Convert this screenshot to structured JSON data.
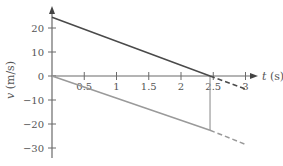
{
  "chart_data": {
    "type": "line",
    "title": "",
    "xlabel": "t (s)",
    "ylabel": "v (m/s)",
    "xlim": [
      0,
      3.2
    ],
    "ylim": [
      -33,
      28
    ],
    "xticks": [
      0.5,
      1,
      1.5,
      2,
      2.5,
      3
    ],
    "xtick_labels": [
      "0.5",
      "1",
      "1.5",
      "2",
      "2.5",
      "3"
    ],
    "yticks": [
      20,
      10,
      0,
      -10,
      -20,
      -30
    ],
    "ytick_labels": [
      "20",
      "10",
      "0",
      "−10",
      "−20",
      "−30"
    ],
    "grid": false,
    "legend": null,
    "series": [
      {
        "name": "upper",
        "color": "#4a4a4a",
        "style": "solid",
        "x": [
          0,
          2.45
        ],
        "y": [
          24.5,
          0
        ]
      },
      {
        "name": "upper-extension",
        "color": "#4a4a4a",
        "style": "dashed",
        "x": [
          2.45,
          3.0
        ],
        "y": [
          0,
          -5.4
        ]
      },
      {
        "name": "lower",
        "color": "#9a9a9a",
        "style": "solid",
        "x": [
          0,
          2.45
        ],
        "y": [
          0,
          -22.6
        ]
      },
      {
        "name": "lower-extension",
        "color": "#9a9a9a",
        "style": "dashed",
        "x": [
          2.45,
          3.0
        ],
        "y": [
          -22.6,
          -28.5
        ]
      }
    ],
    "annotations": [
      {
        "type": "vertical-line",
        "x": 2.45,
        "y_from": 0,
        "y_to": -22.6,
        "color": "#9a9a9a"
      }
    ]
  },
  "axes": {
    "x_label_var": "t",
    "x_label_unit": " (s)",
    "y_label_var": "v",
    "y_label_unit": " (m/s)"
  },
  "colors": {
    "axis": "#6a6a6a",
    "upper_line": "#4a4a4a",
    "lower_line": "#9a9a9a"
  }
}
